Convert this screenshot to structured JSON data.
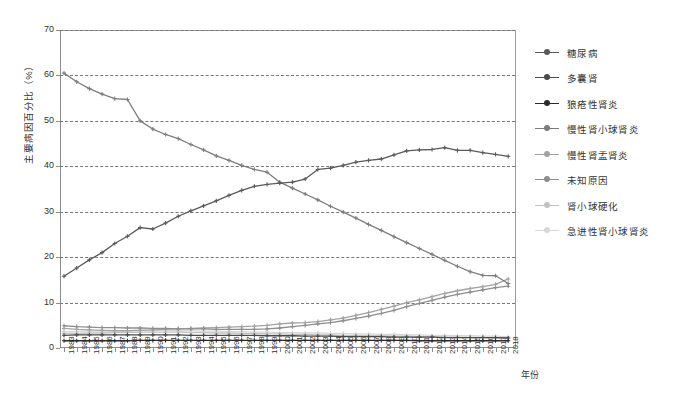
{
  "chart_data": {
    "type": "line",
    "title": "",
    "xlabel": "年份",
    "ylabel": "主要病因百分比（%）",
    "ylim": [
      0,
      70
    ],
    "ytick_step": 10,
    "yticks": [
      0,
      10,
      20,
      30,
      40,
      50,
      60,
      70
    ],
    "grid": true,
    "grid_style": "dashed-horizontal",
    "legend_position": "right",
    "categories": [
      "1983",
      "1984",
      "1985",
      "1986",
      "1987",
      "1988",
      "1989",
      "1990",
      "1991",
      "1992",
      "1993",
      "1994",
      "1995",
      "1996",
      "1997",
      "1998",
      "1999",
      "2000",
      "2001",
      "2002",
      "2003",
      "2004",
      "2005",
      "2006",
      "2007",
      "2008",
      "2009",
      "2010",
      "2011",
      "2012",
      "2013",
      "2014",
      "2015",
      "2016",
      "2017",
      "2018"
    ],
    "series": [
      {
        "name": "糖尿病",
        "color": "#5a5a5a",
        "values": [
          15.8,
          17.6,
          19.4,
          21.0,
          23.0,
          24.6,
          26.5,
          26.2,
          27.5,
          29.0,
          30.2,
          31.3,
          32.4,
          33.6,
          34.7,
          35.6,
          36.0,
          36.3,
          36.5,
          37.2,
          39.3,
          39.6,
          40.2,
          40.9,
          41.3,
          41.6,
          42.5,
          43.4,
          43.6,
          43.7,
          44.1,
          43.5,
          43.5,
          43.0,
          42.6,
          42.2
        ]
      },
      {
        "name": "多囊肾",
        "color": "#4a4a4a",
        "values": [
          2.8,
          2.9,
          2.9,
          2.9,
          2.9,
          2.9,
          2.9,
          2.9,
          2.9,
          2.9,
          2.8,
          2.8,
          2.8,
          2.8,
          2.8,
          2.8,
          2.7,
          2.7,
          2.7,
          2.6,
          2.6,
          2.6,
          2.5,
          2.5,
          2.5,
          2.5,
          2.4,
          2.4,
          2.4,
          2.4,
          2.3,
          2.3,
          2.3,
          2.3,
          2.3,
          2.2
        ]
      },
      {
        "name": "狼疮性肾炎",
        "color": "#2b2b2b",
        "values": [
          1.6,
          1.6,
          1.6,
          1.6,
          1.6,
          1.6,
          1.7,
          1.7,
          1.7,
          1.7,
          1.7,
          1.7,
          1.7,
          1.7,
          1.7,
          1.7,
          1.7,
          1.7,
          1.7,
          1.7,
          1.7,
          1.7,
          1.7,
          1.7,
          1.7,
          1.7,
          1.7,
          1.7,
          1.6,
          1.6,
          1.6,
          1.6,
          1.6,
          1.6,
          1.6,
          1.6
        ]
      },
      {
        "name": "慢性肾小球肾炎",
        "color": "#7d7d7d",
        "values": [
          60.5,
          58.6,
          57.1,
          55.9,
          54.9,
          54.7,
          50.0,
          48.2,
          47.0,
          46.1,
          44.8,
          43.6,
          42.3,
          41.3,
          40.2,
          39.3,
          38.7,
          36.5,
          35.2,
          33.9,
          32.6,
          31.2,
          29.9,
          28.6,
          27.2,
          25.9,
          24.5,
          23.2,
          21.9,
          20.6,
          19.3,
          18.0,
          16.8,
          16.0,
          15.9,
          14.2
        ]
      },
      {
        "name": "慢性肾盂肾炎",
        "color": "#a3a3a3",
        "values": [
          4.3,
          4.1,
          4.0,
          3.9,
          3.8,
          3.8,
          3.9,
          4.0,
          4.1,
          4.2,
          4.3,
          4.4,
          4.5,
          4.6,
          4.7,
          4.8,
          5.0,
          5.3,
          5.5,
          5.6,
          5.8,
          6.2,
          6.6,
          7.2,
          7.8,
          8.5,
          9.2,
          10.0,
          10.6,
          11.3,
          12.0,
          12.6,
          13.1,
          13.5,
          14.0,
          15.2
        ]
      },
      {
        "name": "未知原因",
        "color": "#8e8e8e",
        "values": [
          4.9,
          4.7,
          4.6,
          4.5,
          4.5,
          4.4,
          4.4,
          4.3,
          4.3,
          4.2,
          4.2,
          4.2,
          4.1,
          4.1,
          4.1,
          4.1,
          4.2,
          4.4,
          4.7,
          5.0,
          5.3,
          5.6,
          6.0,
          6.5,
          7.0,
          7.6,
          8.3,
          9.1,
          9.8,
          10.5,
          11.2,
          11.8,
          12.3,
          12.8,
          13.3,
          13.6
        ]
      },
      {
        "name": "肾小球硬化",
        "color": "#c2c2c2",
        "values": [
          3.2,
          3.2,
          3.3,
          3.3,
          3.4,
          3.4,
          3.5,
          3.5,
          3.5,
          3.5,
          3.4,
          3.4,
          3.3,
          3.3,
          3.2,
          3.2,
          3.1,
          3.1,
          3.0,
          3.0,
          2.9,
          2.9,
          2.8,
          2.8,
          2.7,
          2.7,
          2.6,
          2.6,
          2.5,
          2.5,
          2.4,
          2.4,
          2.3,
          2.3,
          2.2,
          2.2
        ]
      },
      {
        "name": "急进性肾小球肾炎",
        "color": "#d8d8d8",
        "values": [
          3.6,
          3.6,
          3.7,
          3.7,
          3.8,
          3.8,
          3.9,
          3.9,
          3.9,
          3.8,
          3.8,
          3.7,
          3.7,
          3.6,
          3.6,
          3.5,
          3.5,
          3.4,
          3.4,
          3.3,
          3.3,
          3.2,
          3.2,
          3.1,
          3.1,
          3.0,
          3.0,
          2.9,
          2.9,
          2.8,
          2.8,
          2.7,
          2.7,
          2.6,
          2.6,
          2.5
        ]
      }
    ]
  }
}
